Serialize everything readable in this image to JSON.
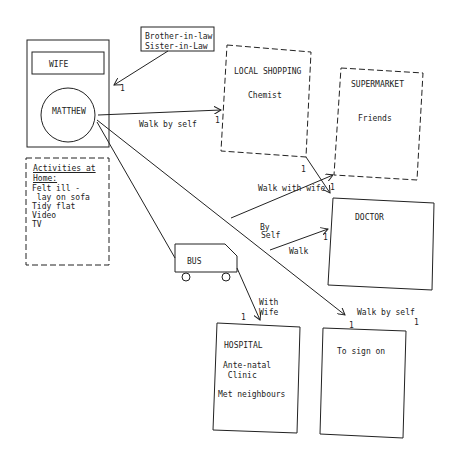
{
  "diagram": {
    "nodes": {
      "home": {
        "wife": "WIFE",
        "matthew": "MATTHEW"
      },
      "inlaws": {
        "line1": "Brother-in-law",
        "line2": "Sister-in-Law"
      },
      "activities": {
        "heading1": "Activities at",
        "heading2": "Home:",
        "items": [
          "Felt ill -",
          " lay on sofa",
          "Tidy flat",
          "Video",
          "TV"
        ]
      },
      "local_shopping": {
        "title": "LOCAL SHOPPING",
        "item": "Chemist"
      },
      "supermarket": {
        "title": "SUPERMARKET",
        "item": "Friends"
      },
      "doctor": {
        "title": "DOCTOR"
      },
      "bus": {
        "label": "BUS"
      },
      "hospital": {
        "title": "HOSPITAL",
        "item1": "Ante-natal",
        "item2": " Clinic",
        "item3": "Met neighbours"
      },
      "sign_on": {
        "title": "To sign on"
      }
    },
    "edges": {
      "inlaws_count": "1",
      "walk_by_self_1": "Walk by self",
      "walk_by_self_1_count": "1",
      "shop_to_super_count": "1",
      "walk_with_wife": "Walk with wife",
      "walk_with_wife_count": "1",
      "by_self_1": "By",
      "by_self_2": "Self",
      "walk": "Walk",
      "walk_count": "1",
      "with_wife_1": "With",
      "with_wife_2": "Wife",
      "with_wife_count": "1",
      "walk_by_self_2": "Walk by self",
      "walk_by_self_2_count_a": "1",
      "walk_by_self_2_count_b": "1"
    }
  }
}
